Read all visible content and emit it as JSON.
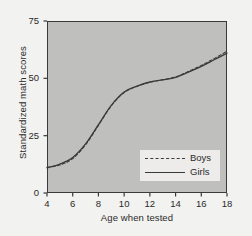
{
  "chart_data": {
    "type": "line",
    "title": "",
    "xlabel": "Age when tested",
    "ylabel": "Standardized math scores",
    "xlim": [
      4,
      18
    ],
    "ylim": [
      0,
      75
    ],
    "xticks": [
      4,
      6,
      8,
      10,
      12,
      14,
      16,
      18
    ],
    "yticks": [
      0,
      25,
      50,
      75
    ],
    "xtick_labels": [
      "4",
      "6",
      "8",
      "10",
      "12",
      "14",
      "16",
      "18"
    ],
    "ytick_labels": [
      "0",
      "25",
      "50",
      "75"
    ],
    "grid": false,
    "legend_position": "lower right",
    "x": [
      4,
      5,
      6,
      7,
      8,
      9,
      10,
      11,
      12,
      13,
      14,
      15,
      16,
      17,
      18
    ],
    "series": [
      {
        "name": "Boys",
        "style": "dashed",
        "color": "#3a3a3a",
        "values": [
          11.2,
          12.2,
          15.0,
          21.0,
          29.5,
          38.0,
          43.8,
          46.5,
          48.3,
          49.4,
          50.6,
          53.0,
          55.6,
          58.6,
          61.8
        ]
      },
      {
        "name": "Girls",
        "style": "solid",
        "color": "#3a3a3a",
        "values": [
          11.0,
          12.6,
          15.5,
          21.4,
          29.8,
          38.2,
          44.0,
          46.6,
          48.4,
          49.3,
          50.4,
          52.7,
          55.2,
          58.1,
          61.0
        ]
      }
    ]
  },
  "legend": {
    "entries": [
      {
        "label": "Boys"
      },
      {
        "label": "Girls"
      }
    ]
  },
  "colors": {
    "figure_background": "#f2f2f0",
    "plot_background": "#bfbfbd",
    "axis": "#3a3a3a",
    "line": "#3a3a3a",
    "legend_background": "#edeceb",
    "text": "#2a2a2a"
  }
}
